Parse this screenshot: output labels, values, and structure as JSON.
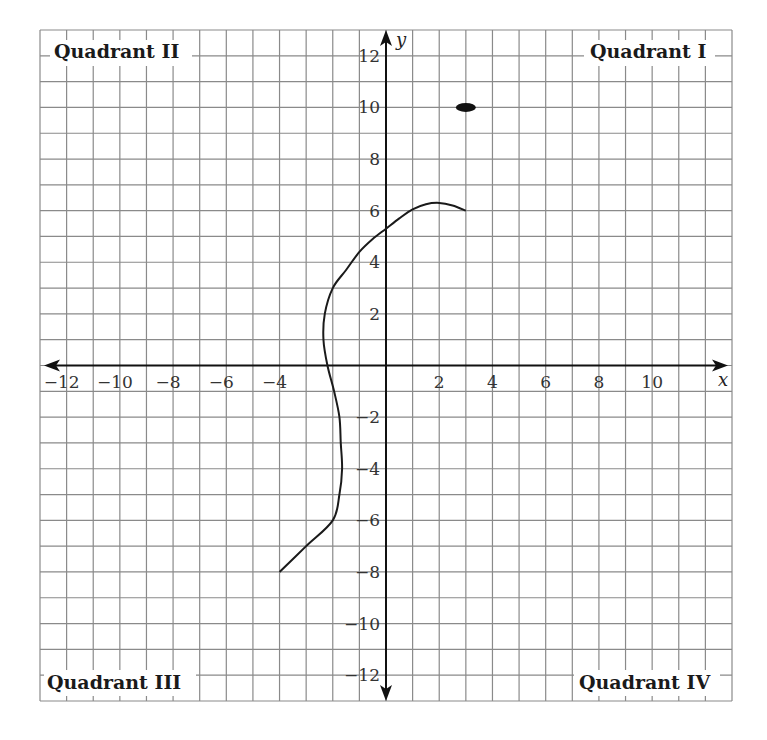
{
  "chart_data": {
    "type": "line",
    "title": "",
    "xlabel": "x",
    "ylabel": "y",
    "xlim": [
      -13,
      13
    ],
    "ylim": [
      -13,
      13
    ],
    "grid": true,
    "x_ticks": [
      -12,
      -10,
      -8,
      -6,
      -4,
      2,
      4,
      6,
      8,
      10
    ],
    "y_ticks": [
      12,
      10,
      8,
      6,
      4,
      2,
      -2,
      -4,
      -6,
      -8,
      -10,
      -12
    ],
    "quadrant_labels": {
      "I": "Quadrant I",
      "II": "Quadrant II",
      "III": "Quadrant III",
      "IV": "Quadrant IV"
    },
    "series": [
      {
        "name": "curve",
        "type": "line",
        "points": [
          [
            -4,
            -8
          ],
          [
            -3,
            -7
          ],
          [
            -2,
            -6
          ],
          [
            -1.75,
            -5
          ],
          [
            -1.65,
            -4
          ],
          [
            -1.7,
            -3
          ],
          [
            -1.75,
            -2
          ],
          [
            -1.95,
            -1
          ],
          [
            -2.2,
            0
          ],
          [
            -2.35,
            1
          ],
          [
            -2.3,
            2
          ],
          [
            -2.0,
            3
          ],
          [
            -1.5,
            3.7
          ],
          [
            -1,
            4.4
          ],
          [
            -0.5,
            4.9
          ],
          [
            0,
            5.3
          ],
          [
            0.5,
            5.7
          ],
          [
            1,
            6.05
          ],
          [
            1.5,
            6.25
          ],
          [
            2,
            6.3
          ],
          [
            2.5,
            6.2
          ],
          [
            3,
            6
          ]
        ]
      },
      {
        "name": "point",
        "type": "scatter",
        "points": [
          [
            3,
            10
          ]
        ]
      }
    ]
  }
}
